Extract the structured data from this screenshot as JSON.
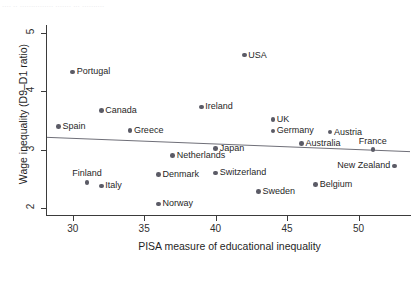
{
  "figure": {
    "top_cut_text": "....  ..  ............... ....... ... ..........",
    "background": "#ffffff",
    "dot_color": "#5b5b66",
    "axis_color": "#3b3b3b",
    "line_color": "#6f6f78"
  },
  "chart_data": {
    "type": "scatter",
    "title": "",
    "xlabel": "PISA measure of educational inequality",
    "ylabel": "Wage inequality (D9–D1 ratio)",
    "xlim": [
      28.2,
      53.6
    ],
    "ylim": [
      1.88,
      5.1
    ],
    "xticks": [
      30,
      35,
      40,
      45,
      50
    ],
    "yticks": [
      2,
      3,
      4,
      5
    ],
    "xtick_labels": [
      "30",
      "35",
      "40",
      "45",
      "50"
    ],
    "ytick_labels": [
      "2",
      "3",
      "4",
      "5"
    ],
    "grid": false,
    "legend": "none",
    "points": [
      {
        "label": "Spain",
        "x": 29.0,
        "y": 3.4,
        "pos": "right"
      },
      {
        "label": "Portugal",
        "x": 30.0,
        "y": 4.33,
        "pos": "right"
      },
      {
        "label": "Finland",
        "x": 31.0,
        "y": 2.44,
        "pos": "above"
      },
      {
        "label": "Italy",
        "x": 32.0,
        "y": 2.38,
        "pos": "right"
      },
      {
        "label": "Canada",
        "x": 32.0,
        "y": 3.67,
        "pos": "right"
      },
      {
        "label": "Greece",
        "x": 34.0,
        "y": 3.33,
        "pos": "right"
      },
      {
        "label": "Denmark",
        "x": 36.0,
        "y": 2.57,
        "pos": "right"
      },
      {
        "label": "Norway",
        "x": 36.0,
        "y": 2.07,
        "pos": "right"
      },
      {
        "label": "Netherlands",
        "x": 37.0,
        "y": 2.9,
        "pos": "right"
      },
      {
        "label": "Ireland",
        "x": 39.0,
        "y": 3.73,
        "pos": "right"
      },
      {
        "label": "Japan",
        "x": 40.0,
        "y": 3.02,
        "pos": "right"
      },
      {
        "label": "Switzerland",
        "x": 40.0,
        "y": 2.6,
        "pos": "right"
      },
      {
        "label": "USA",
        "x": 42.0,
        "y": 4.62,
        "pos": "right"
      },
      {
        "label": "Sweden",
        "x": 43.0,
        "y": 2.28,
        "pos": "right"
      },
      {
        "label": "UK",
        "x": 44.0,
        "y": 3.52,
        "pos": "right"
      },
      {
        "label": "Germany",
        "x": 44.0,
        "y": 3.32,
        "pos": "right"
      },
      {
        "label": "Australia",
        "x": 46.0,
        "y": 3.1,
        "pos": "right"
      },
      {
        "label": "Belgium",
        "x": 47.0,
        "y": 2.4,
        "pos": "right"
      },
      {
        "label": "Austria",
        "x": 48.0,
        "y": 3.3,
        "pos": "right"
      },
      {
        "label": "France",
        "x": 51.0,
        "y": 3.0,
        "pos": "above"
      },
      {
        "label": "New Zealand",
        "x": 52.5,
        "y": 2.72,
        "pos": "left"
      }
    ],
    "fit_line": {
      "name": "linear-fit",
      "x0": 28.2,
      "y0": 3.21,
      "x1": 53.6,
      "y1": 2.965
    }
  }
}
